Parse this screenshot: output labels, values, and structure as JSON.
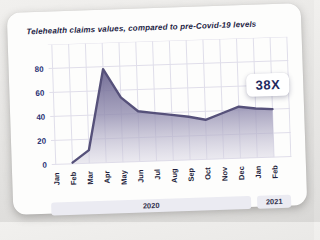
{
  "page": {
    "background_top": "#f1f0ee",
    "background_bottom": "#d9d8d6"
  },
  "card": {
    "background": "#fdfdfc",
    "tilt_deg": -1.9
  },
  "chart_data": {
    "type": "area",
    "title": "Telehealth claims values, compared to pre-Covid-19 levels",
    "categories": [
      "Jan",
      "Feb",
      "Mar",
      "Apr",
      "May",
      "Jun",
      "Jul",
      "Aug",
      "Sep",
      "Oct",
      "Nov",
      "Dec",
      "Jan",
      "Feb"
    ],
    "values": [
      null,
      1,
      11,
      78,
      54,
      42,
      40,
      38,
      36,
      33,
      38,
      43,
      41,
      40
    ],
    "ylim": [
      0,
      100
    ],
    "yticks": [
      0,
      20,
      40,
      60,
      80
    ],
    "xlabel": "",
    "ylabel": "",
    "grid": true,
    "legend": false,
    "annotation": {
      "label": "38X"
    },
    "year_groups": [
      {
        "label": "2020",
        "months": 12
      },
      {
        "label": "2021",
        "months": 2
      }
    ],
    "colors": {
      "title": "#1c1c44",
      "line": "#56517a",
      "fill_top": "#6b6590",
      "fill_mid": "#948fb1",
      "fill_bottom": "#d9d6e4",
      "grid": "#e0deea",
      "ytick_text": "#2b3375",
      "month_text": "#1f1f3c",
      "badge_text": "#1f2a5e",
      "band_bg": "#ebebf2",
      "band_text": "#33334f"
    }
  }
}
